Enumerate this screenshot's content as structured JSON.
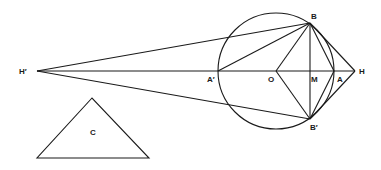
{
  "diagram": {
    "points": {
      "H_prime": {
        "label": "H′",
        "x": 37,
        "y": 71
      },
      "A_prime": {
        "label": "A′",
        "x": 218,
        "y": 71
      },
      "O": {
        "label": "O",
        "x": 276,
        "y": 71
      },
      "M": {
        "label": "M",
        "x": 310,
        "y": 71
      },
      "A": {
        "label": "A",
        "x": 334,
        "y": 71
      },
      "H": {
        "label": "H",
        "x": 355,
        "y": 71
      },
      "B": {
        "label": "B",
        "x": 310,
        "y": 23
      },
      "B_prime": {
        "label": "B′",
        "x": 310,
        "y": 119
      }
    },
    "circle": {
      "cx": 276,
      "cy": 71,
      "r": 58
    },
    "triangle": {
      "label": "C",
      "apex": [
        92,
        98
      ],
      "base_left": [
        37,
        158
      ],
      "base_right": [
        149,
        158
      ]
    },
    "labels": {
      "H_prime": "H′",
      "A_prime": "A′",
      "O": "O",
      "M": "M",
      "A": "A",
      "H": "H",
      "B": "B",
      "B_prime": "B′",
      "C": "C"
    }
  }
}
